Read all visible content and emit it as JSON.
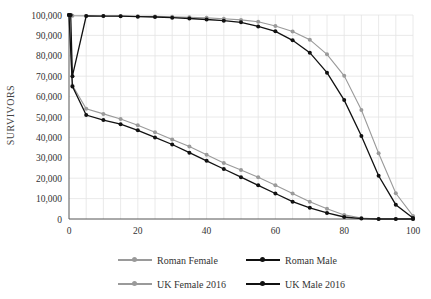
{
  "chart_data": {
    "type": "line",
    "title": "",
    "xlabel": "",
    "ylabel": "SURVIVORS",
    "xlim": [
      0,
      100
    ],
    "ylim": [
      0,
      100000
    ],
    "x_ticks": [
      0,
      20,
      40,
      60,
      80,
      100
    ],
    "y_ticks": [
      0,
      10000,
      20000,
      30000,
      40000,
      50000,
      60000,
      70000,
      80000,
      90000,
      100000
    ],
    "y_tick_labels": [
      "0",
      "10,000",
      "20,000",
      "30,000",
      "40,000",
      "50,000",
      "60,000",
      "70,000",
      "80,000",
      "90,000",
      "100,000"
    ],
    "x_tick_labels": [
      "0",
      "20",
      "40",
      "60",
      "80",
      "100"
    ],
    "grid": true,
    "legend_position": "bottom",
    "series": [
      {
        "name": "Roman Female",
        "color": "#9a9a9a",
        "x": [
          0,
          1,
          5,
          10,
          15,
          20,
          25,
          30,
          35,
          40,
          45,
          50,
          55,
          60,
          65,
          70,
          75,
          80,
          85,
          90,
          95,
          100
        ],
        "values": [
          100000,
          65500,
          54000,
          51500,
          49000,
          46000,
          42500,
          39000,
          35500,
          31500,
          27500,
          24000,
          20500,
          16500,
          12500,
          8500,
          5000,
          2000,
          500,
          0,
          0,
          0
        ]
      },
      {
        "name": "Roman Male",
        "color": "#111111",
        "x": [
          0,
          1,
          5,
          10,
          15,
          20,
          25,
          30,
          35,
          40,
          45,
          50,
          55,
          60,
          65,
          70,
          75,
          80,
          85,
          90,
          95,
          100
        ],
        "values": [
          100000,
          65000,
          51000,
          48500,
          46500,
          43500,
          40000,
          36500,
          32500,
          28500,
          24500,
          20500,
          16500,
          12500,
          8500,
          5500,
          3000,
          1000,
          200,
          0,
          0,
          0
        ]
      },
      {
        "name": "UK Female 2016",
        "color": "#9a9a9a",
        "x": [
          0,
          1,
          5,
          10,
          15,
          20,
          25,
          30,
          35,
          40,
          45,
          50,
          55,
          60,
          65,
          70,
          75,
          80,
          85,
          90,
          95,
          100
        ],
        "values": [
          100000,
          99600,
          99550,
          99500,
          99450,
          99400,
          99300,
          99100,
          98900,
          98600,
          98200,
          97600,
          96700,
          94600,
          91900,
          87900,
          80700,
          70200,
          53400,
          32200,
          12600,
          1500
        ]
      },
      {
        "name": "UK Male 2016",
        "color": "#111111",
        "x": [
          0,
          0.5,
          1,
          5,
          10,
          15,
          20,
          25,
          30,
          35,
          40,
          45,
          50,
          55,
          60,
          65,
          70,
          75,
          80,
          85,
          90,
          95,
          100
        ],
        "values": [
          100000,
          100000,
          70000,
          99500,
          99450,
          99400,
          99200,
          99000,
          98700,
          98300,
          97800,
          97200,
          96400,
          94400,
          92000,
          87600,
          81500,
          71700,
          58300,
          40700,
          21200,
          7000,
          500
        ]
      }
    ]
  },
  "legend": {
    "items": [
      {
        "label": "Roman Female",
        "color": "#9a9a9a"
      },
      {
        "label": "Roman Male",
        "color": "#111111"
      },
      {
        "label": "UK Female 2016",
        "color": "#9a9a9a"
      },
      {
        "label": "UK Male 2016",
        "color": "#111111"
      }
    ]
  },
  "axis": {
    "ylabel": "SURVIVORS"
  },
  "colors": {
    "grid": "#e4e4e4",
    "axis": "#555555",
    "light_series": "#9a9a9a",
    "dark_series": "#111111"
  }
}
